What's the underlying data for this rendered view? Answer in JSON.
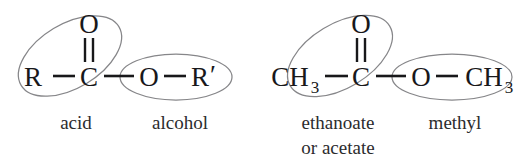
{
  "figure": {
    "background_color": "#ffffff",
    "atom_color": "#18181a",
    "ellipse_color": "#868689",
    "caption_color": "#2b2b2d"
  },
  "molecules": [
    {
      "id": "generic-ester",
      "atoms": {
        "left_group": "R",
        "carbonyl_carbon": "C",
        "carbonyl_oxygen": "O",
        "ester_oxygen": "O",
        "right_group": "R",
        "right_group_prime": "′"
      },
      "bonds": [
        {
          "name": "r-to-carbonyl-carbon",
          "type": "single"
        },
        {
          "name": "carbonyl-double-bond",
          "type": "double"
        },
        {
          "name": "carbonyl-carbon-to-ester-oxygen",
          "type": "single"
        },
        {
          "name": "ester-oxygen-to-r-prime",
          "type": "single"
        }
      ],
      "highlights": [
        {
          "name": "acid-ellipse",
          "label": "acid",
          "label_lines": [
            "acid"
          ]
        },
        {
          "name": "alcohol-ellipse",
          "label": "alcohol",
          "label_lines": [
            "alcohol"
          ]
        }
      ]
    },
    {
      "id": "methyl-ethanoate",
      "atoms": {
        "left_group": "CH",
        "left_group_sub": "3",
        "carbonyl_carbon": "C",
        "carbonyl_oxygen": "O",
        "ester_oxygen": "O",
        "right_group": "CH",
        "right_group_sub": "3"
      },
      "bonds": [
        {
          "name": "methyl-to-carbonyl-carbon",
          "type": "single"
        },
        {
          "name": "carbonyl-double-bond",
          "type": "double"
        },
        {
          "name": "carbonyl-carbon-to-ester-oxygen",
          "type": "single"
        },
        {
          "name": "ester-oxygen-to-methyl",
          "type": "single"
        }
      ],
      "highlights": [
        {
          "name": "ethanoate-ellipse",
          "label": "ethanoate or acetate",
          "label_lines": [
            "ethanoate",
            "or acetate"
          ]
        },
        {
          "name": "methyl-ellipse",
          "label": "methyl",
          "label_lines": [
            "methyl"
          ]
        }
      ]
    }
  ],
  "captions": {
    "acid": "acid",
    "alcohol": "alcohol",
    "ethanoate_line1": "ethanoate",
    "ethanoate_line2": "or acetate",
    "methyl": "methyl"
  }
}
